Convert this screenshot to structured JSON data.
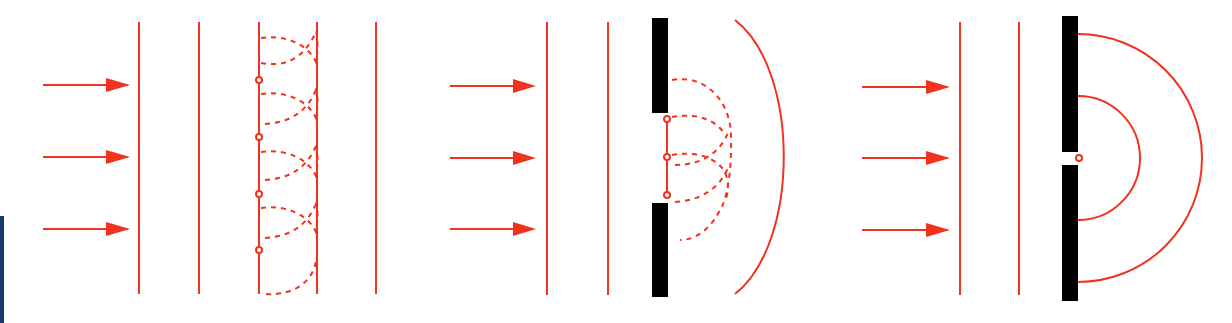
{
  "colors": {
    "wave": "#f0321e",
    "barrier": "#000000",
    "background": "#ffffff",
    "edge_accent": "#163a6b"
  },
  "panels": [
    {
      "id": "free-propagation",
      "description": "Plane wave propagating freely; secondary wavelets from point sources on a wavefront rebuild the next plane wavefront",
      "incident_arrows": 3,
      "plane_wavefronts": 5,
      "secondary_sources": 4,
      "wavelet_style": "dashed",
      "barrier": false
    },
    {
      "id": "wide-aperture",
      "description": "Plane wave hitting a barrier with a wide opening; wavelets from sources in the opening form a curved wavefront",
      "incident_arrows": 3,
      "plane_wavefronts": 2,
      "secondary_sources": 3,
      "wavelet_style": "dashed",
      "barrier": true,
      "aperture": "wide",
      "emerging_wavefronts": 1
    },
    {
      "id": "narrow-aperture",
      "description": "Plane wave hitting a barrier with a narrow slit; a single point source emits semicircular wavefronts",
      "incident_arrows": 3,
      "plane_wavefronts": 2,
      "secondary_sources": 1,
      "barrier": true,
      "aperture": "narrow",
      "emerging_wavefronts": 2
    }
  ]
}
